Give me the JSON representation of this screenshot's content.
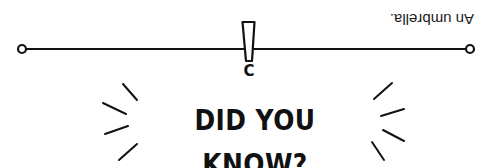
{
  "answer": {
    "text": "An umbrella.",
    "orientation": "upside-down"
  },
  "heading": {
    "text": "DID YOU KNOW?"
  },
  "marker": {
    "letter": "C"
  },
  "colors": {
    "ink": "#111111",
    "background": "#ffffff"
  },
  "icons": {
    "line": "balance-line",
    "left_end": "circle-endpoint-icon",
    "right_end": "circle-endpoint-icon",
    "fulcrum": "exclamation-mark-icon",
    "rays": "burst-rays-icon"
  }
}
